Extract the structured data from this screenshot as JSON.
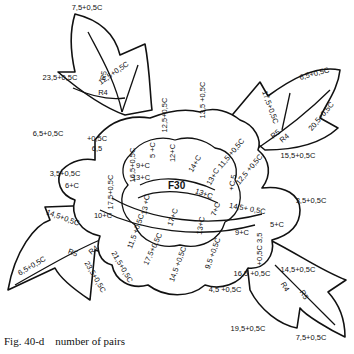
{
  "caption": "Fig. 40-d    number of pairs",
  "center_label": "F30",
  "labels": [
    {
      "id": "top-leaf-tip",
      "text": "7,5+0,5C",
      "x": 87,
      "y": 10,
      "r": 0
    },
    {
      "id": "top-leaf-left",
      "text": "23,5+0,5C",
      "x": 60,
      "y": 80,
      "r": 0
    },
    {
      "id": "top-leaf-right",
      "text": "12,5+0,5C",
      "x": 115,
      "y": 75,
      "r": -35
    },
    {
      "id": "top-leaf-r5",
      "text": "R5",
      "x": 106,
      "y": 76,
      "r": -80
    },
    {
      "id": "top-leaf-r4",
      "text": "R4",
      "x": 103,
      "y": 95,
      "r": 0
    },
    {
      "id": "left-upper-outer",
      "text": "6,5+0,5C",
      "x": 48,
      "y": 136,
      "r": 0
    },
    {
      "id": "left-upper-inner-a",
      "text": "+0,5C",
      "x": 97,
      "y": 141,
      "r": 0
    },
    {
      "id": "left-upper-inner-b",
      "text": "6,5",
      "x": 97,
      "y": 151,
      "r": 0
    },
    {
      "id": "left-petal-165",
      "text": "16,5+0,5C",
      "x": 135,
      "y": 165,
      "r": -90
    },
    {
      "id": "top-petal-125",
      "text": "12,5+0,5C",
      "x": 167,
      "y": 115,
      "r": -90
    },
    {
      "id": "top-petal-135",
      "text": "13,5 +0,5C",
      "x": 205,
      "y": 100,
      "r": -90
    },
    {
      "id": "left-mid-35",
      "text": "3,5+0,5C",
      "x": 65,
      "y": 176,
      "r": 0
    },
    {
      "id": "left-mid-6c",
      "text": "6+C",
      "x": 72,
      "y": 188,
      "r": 0
    },
    {
      "id": "left-mid-175",
      "text": "17,5+0,5C",
      "x": 113,
      "y": 192,
      "r": -90
    },
    {
      "id": "left-10c",
      "text": "10+C",
      "x": 103,
      "y": 218,
      "r": 0
    },
    {
      "id": "inner-5c",
      "text": "5 +C",
      "x": 155,
      "y": 150,
      "r": -90
    },
    {
      "id": "inner-9c",
      "text": "9+C",
      "x": 143,
      "y": 168,
      "r": 0
    },
    {
      "id": "inner-13c-a",
      "text": "13+C",
      "x": 141,
      "y": 180,
      "r": 0
    },
    {
      "id": "inner-12c",
      "text": "12+C",
      "x": 175,
      "y": 153,
      "r": -90
    },
    {
      "id": "inner-14c",
      "text": "14+C",
      "x": 197,
      "y": 165,
      "r": -60
    },
    {
      "id": "inner-13c-b",
      "text": "13+C",
      "x": 215,
      "y": 178,
      "r": -60
    },
    {
      "id": "inner-13c-c",
      "text": "13 +C",
      "x": 148,
      "y": 205,
      "r": -80
    },
    {
      "id": "inner-17c",
      "text": "17+C",
      "x": 175,
      "y": 218,
      "r": -70
    },
    {
      "id": "inner-13c-d",
      "text": "13+C",
      "x": 203,
      "y": 226,
      "r": -80
    },
    {
      "id": "inner-13c-e",
      "text": "13+C",
      "x": 203,
      "y": 196,
      "r": 20
    },
    {
      "id": "inner-7c",
      "text": "7+C",
      "x": 218,
      "y": 210,
      "r": -70
    },
    {
      "id": "inner-5c-b",
      "text": "+C 5",
      "x": 235,
      "y": 183,
      "r": -80
    },
    {
      "id": "right-115",
      "text": "11,5 +0,5C",
      "x": 233,
      "y": 155,
      "r": -50
    },
    {
      "id": "right-125",
      "text": "12,5 +0,5C",
      "x": 251,
      "y": 171,
      "r": -50
    },
    {
      "id": "right-175",
      "text": "17,5+0,5C",
      "x": 268,
      "y": 108,
      "r": 70
    },
    {
      "id": "right-leaf-tip",
      "text": "6,5+0,5C",
      "x": 315,
      "y": 76,
      "r": -15
    },
    {
      "id": "right-leaf-205",
      "text": "20,5+0,5C",
      "x": 323,
      "y": 118,
      "r": -50
    },
    {
      "id": "right-leaf-155",
      "text": "15,5+0,5C",
      "x": 298,
      "y": 158,
      "r": 0
    },
    {
      "id": "right-leaf-r5",
      "text": "R5",
      "x": 277,
      "y": 136,
      "r": -40
    },
    {
      "id": "right-leaf-r4",
      "text": "R4",
      "x": 286,
      "y": 140,
      "r": -40
    },
    {
      "id": "right-35",
      "text": "3,5+0,5C",
      "x": 311,
      "y": 203,
      "r": 0
    },
    {
      "id": "right-145",
      "text": "14,5+ 0,5C",
      "x": 247,
      "y": 211,
      "r": 10
    },
    {
      "id": "right-5c",
      "text": "5+C",
      "x": 277,
      "y": 227,
      "r": 0
    },
    {
      "id": "right-9c",
      "text": "9+C",
      "x": 242,
      "y": 235,
      "r": 0
    },
    {
      "id": "bottom-95",
      "text": "9,5 +0,5C",
      "x": 215,
      "y": 254,
      "r": -70
    },
    {
      "id": "bottom-145",
      "text": "14,5 +0,5C",
      "x": 180,
      "y": 265,
      "r": -70
    },
    {
      "id": "bottom-175",
      "text": "17,5+0,5C",
      "x": 155,
      "y": 250,
      "r": -65
    },
    {
      "id": "bottom-115",
      "text": "11,5 +0,5C",
      "x": 138,
      "y": 232,
      "r": -70
    },
    {
      "id": "bottom-45",
      "text": "4,5 +0,5C",
      "x": 225,
      "y": 292,
      "r": 0
    },
    {
      "id": "bottom-right-inner",
      "text": "+0,5C 3,5",
      "x": 262,
      "y": 249,
      "r": -90
    },
    {
      "id": "bottom-right-165",
      "text": "16,5 +0,5C",
      "x": 252,
      "y": 276,
      "r": 0
    },
    {
      "id": "bottom-right-145",
      "text": "14,5+0,5C",
      "x": 298,
      "y": 272,
      "r": 0
    },
    {
      "id": "bottom-right-r4",
      "text": "R4",
      "x": 283,
      "y": 288,
      "r": 60
    },
    {
      "id": "bottom-right-r5",
      "text": "R5",
      "x": 302,
      "y": 296,
      "r": 60
    },
    {
      "id": "bottom-right-195",
      "text": "19,5+0,5C",
      "x": 248,
      "y": 331,
      "r": 0
    },
    {
      "id": "bottom-right-75",
      "text": "7,5+0,5C",
      "x": 311,
      "y": 340,
      "r": 0
    },
    {
      "id": "left-leaf-145",
      "text": "14,5+0,5C",
      "x": 62,
      "y": 220,
      "r": 20
    },
    {
      "id": "left-leaf-65",
      "text": "6,5+0,5C",
      "x": 33,
      "y": 268,
      "r": -30
    },
    {
      "id": "left-leaf-r5",
      "text": "R5",
      "x": 72,
      "y": 255,
      "r": 20
    },
    {
      "id": "left-leaf-r4",
      "text": "R4",
      "x": 95,
      "y": 252,
      "r": -40
    },
    {
      "id": "left-leaf-235",
      "text": "23,5+0,5C",
      "x": 93,
      "y": 278,
      "r": 60
    },
    {
      "id": "left-leaf-215",
      "text": "21,5+0,5C",
      "x": 120,
      "y": 268,
      "r": 60
    }
  ]
}
